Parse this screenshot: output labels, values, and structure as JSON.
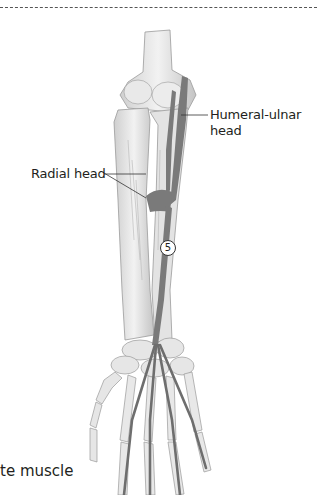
{
  "figure": {
    "type": "anatomical-illustration",
    "colors": {
      "bone": "#e6e6e6",
      "bone_shadow": "#bdbdbd",
      "muscle": "#7a7a7a",
      "leader_line": "#333333",
      "dash_line": "#555555"
    }
  },
  "labels": {
    "humeral_ulnar_line1": "Humeral-ulnar",
    "humeral_ulnar_line2": "head",
    "radial_head": "Radial head",
    "marker_number": "5"
  },
  "caption": {
    "text": "te muscle"
  }
}
